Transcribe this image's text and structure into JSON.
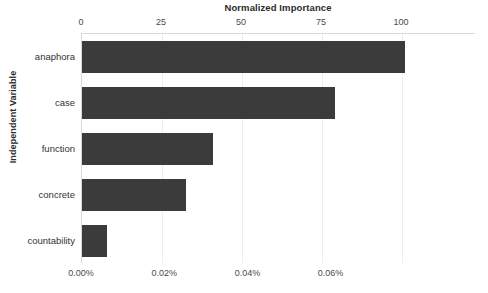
{
  "chart_data": {
    "type": "bar",
    "orientation": "horizontal",
    "title": "Normalized Importance",
    "xlabel": "Normalized Importance",
    "ylabel": "Independent Variable",
    "categories": [
      "anaphora",
      "case",
      "function",
      "concrete",
      "countability"
    ],
    "values": [
      101,
      79,
      41,
      32.5,
      7.8
    ],
    "secondary_values_percent": [
      0.0194,
      0.0152,
      0.0079,
      0.0063,
      0.0015
    ],
    "xlim": [
      0,
      123
    ],
    "grid": true,
    "legend": null,
    "bar_color": "#3b3b3b",
    "axis_top": {
      "label": "Normalized Importance",
      "ticks": [
        {
          "value": 0,
          "text": "0"
        },
        {
          "value": 25,
          "text": "25"
        },
        {
          "value": 50,
          "text": "50"
        },
        {
          "value": 75,
          "text": "75"
        },
        {
          "value": 100,
          "text": "100"
        }
      ]
    },
    "axis_bottom": {
      "ticks": [
        {
          "value": 0,
          "text": "0.00%"
        },
        {
          "value": 26,
          "text": "0.02%"
        },
        {
          "value": 52,
          "text": "0.04%"
        },
        {
          "value": 78,
          "text": "0.06%"
        }
      ]
    },
    "gridlines_at": [
      25,
      50,
      75,
      100
    ]
  }
}
